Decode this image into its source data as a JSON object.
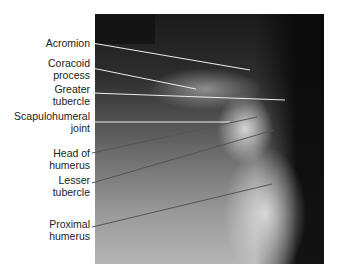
{
  "figure": {
    "side_marker": "L",
    "labels": [
      {
        "id": "acromion",
        "lines": [
          "Acromion"
        ]
      },
      {
        "id": "coracoid",
        "lines": [
          "Coracoid",
          "process"
        ]
      },
      {
        "id": "greater-tubercle",
        "lines": [
          "Greater",
          "tubercle"
        ]
      },
      {
        "id": "scapulohumeral",
        "lines": [
          "Scapulohumeral",
          "joint"
        ]
      },
      {
        "id": "head-humerus",
        "lines": [
          "Head of",
          "humerus"
        ]
      },
      {
        "id": "lesser-tubercle",
        "lines": [
          "Lesser",
          "tubercle"
        ]
      },
      {
        "id": "proximal-humerus",
        "lines": [
          "Proximal",
          "humerus"
        ]
      }
    ]
  }
}
